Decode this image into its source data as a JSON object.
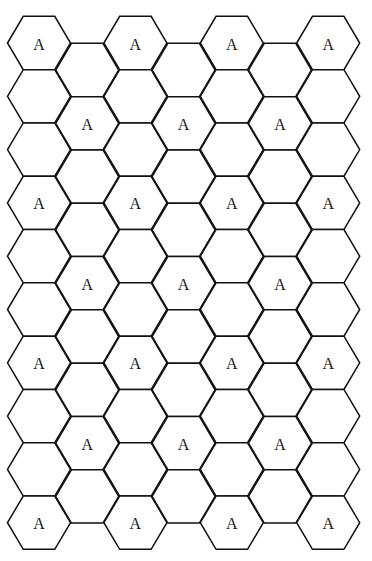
{
  "diagram": {
    "type": "hexagonal-grid",
    "orientation": "flat-top",
    "stroke_color": "#111111",
    "fill_color": "#ffffff",
    "label_color": "#1a1a1a",
    "geometry": {
      "hex_radius": 31.5,
      "hex_half_height": 26.65,
      "column_step_x": 48.2,
      "first_column_x": 39,
      "row_step_y": 53.3,
      "even_column_first_y": 43,
      "odd_column_first_y": 70
    },
    "columns": [
      {
        "index": 0,
        "cells": [
          "A",
          "",
          "",
          "A",
          "",
          "",
          "A",
          "",
          "",
          "A"
        ]
      },
      {
        "index": 1,
        "cells": [
          "",
          "A",
          "",
          "",
          "A",
          "",
          "",
          "A",
          ""
        ]
      },
      {
        "index": 2,
        "cells": [
          "A",
          "",
          "",
          "A",
          "",
          "",
          "A",
          "",
          "",
          "A"
        ]
      },
      {
        "index": 3,
        "cells": [
          "",
          "A",
          "",
          "",
          "A",
          "",
          "",
          "A",
          ""
        ]
      },
      {
        "index": 4,
        "cells": [
          "A",
          "",
          "",
          "A",
          "",
          "",
          "A",
          "",
          "",
          "A"
        ]
      },
      {
        "index": 5,
        "cells": [
          "",
          "A",
          "",
          "",
          "A",
          "",
          "",
          "A",
          ""
        ]
      },
      {
        "index": 6,
        "cells": [
          "A",
          "",
          "",
          "A",
          "",
          "",
          "A",
          "",
          "",
          "A"
        ]
      }
    ],
    "label_text": "A",
    "labeled_cell_count": 25,
    "total_cell_count": 67
  }
}
